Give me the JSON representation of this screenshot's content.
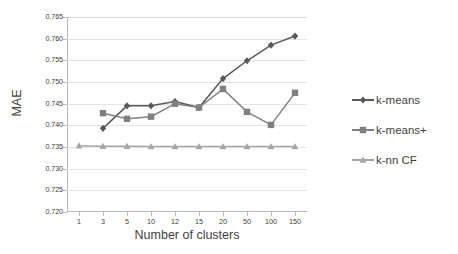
{
  "chart_data": {
    "type": "line",
    "title": "",
    "xlabel": "Number of clusters",
    "ylabel": "MAE",
    "categories": [
      "1",
      "3",
      "5",
      "10",
      "12",
      "15",
      "20",
      "50",
      "100",
      "150"
    ],
    "ylim": [
      0.72,
      0.765
    ],
    "yticks": [
      "0.765",
      "0.760",
      "0.755",
      "0.750",
      "0.745",
      "0.740",
      "0.735",
      "0.730",
      "0.725",
      "0.720"
    ],
    "ytick_values": [
      0.765,
      0.76,
      0.755,
      0.75,
      0.745,
      0.74,
      0.735,
      0.73,
      0.725,
      0.72
    ],
    "grid": true,
    "legend_position": "right",
    "series": [
      {
        "name": "k-means",
        "marker": "diamond",
        "color": "#595959",
        "values": [
          null,
          0.7393,
          0.7445,
          0.7445,
          0.7455,
          0.7441,
          0.7508,
          0.7549,
          0.7585,
          0.7606
        ]
      },
      {
        "name": "k-means+",
        "marker": "square",
        "color": "#808080",
        "values": [
          null,
          0.7428,
          0.7415,
          0.742,
          0.745,
          0.7441,
          0.7484,
          0.7431,
          0.7401,
          0.7475
        ]
      },
      {
        "name": "k-nn CF",
        "marker": "triangle",
        "color": "#a6a6a6",
        "values": [
          0.7353,
          0.7352,
          0.7352,
          0.7351,
          0.7351,
          0.7351,
          0.7351,
          0.7351,
          0.7351,
          0.7351
        ]
      }
    ]
  },
  "legend": {
    "items": [
      {
        "label": "k-means"
      },
      {
        "label": "k-means+"
      },
      {
        "label": "k-nn CF"
      }
    ]
  },
  "colors": {
    "series_1": "#595959",
    "series_2": "#808080",
    "series_3": "#a6a6a6",
    "axis": "#b9b9b9",
    "grid": "#e4e4e4",
    "text": "#3f3f3f",
    "background": "#ffffff"
  }
}
